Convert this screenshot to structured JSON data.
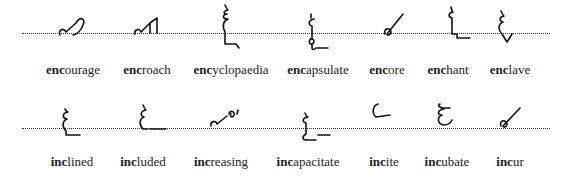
{
  "rows": [
    {
      "prefix": "enc",
      "words": [
        {
          "prefix": "enc",
          "rest": "ourage",
          "full": "encourage"
        },
        {
          "prefix": "enc",
          "rest": "roach",
          "full": "encroach"
        },
        {
          "prefix": "enc",
          "rest": "yclopaedia",
          "full": "encyclopaedia"
        },
        {
          "prefix": "enc",
          "rest": "apsulate",
          "full": "encapsulate"
        },
        {
          "prefix": "enc",
          "rest": "ore",
          "full": "encore"
        },
        {
          "prefix": "enc",
          "rest": "hant",
          "full": "enchant"
        },
        {
          "prefix": "enc",
          "rest": "lave",
          "full": "enclave"
        }
      ]
    },
    {
      "prefix": "inc",
      "words": [
        {
          "prefix": "inc",
          "rest": "lined",
          "full": "inclined"
        },
        {
          "prefix": "inc",
          "rest": "luded",
          "full": "included"
        },
        {
          "prefix": "inc",
          "rest": "reasing",
          "full": "increasing"
        },
        {
          "prefix": "inc",
          "rest": "apacitate",
          "full": "incapacitate"
        },
        {
          "prefix": "inc",
          "rest": "ite",
          "full": "incite"
        },
        {
          "prefix": "inc",
          "rest": "ubate",
          "full": "incubate"
        },
        {
          "prefix": "inc",
          "rest": "ur",
          "full": "incur"
        }
      ]
    }
  ],
  "icons": {
    "outline_style": "shorthand-outline",
    "writing_line": "dotted-baseline"
  }
}
